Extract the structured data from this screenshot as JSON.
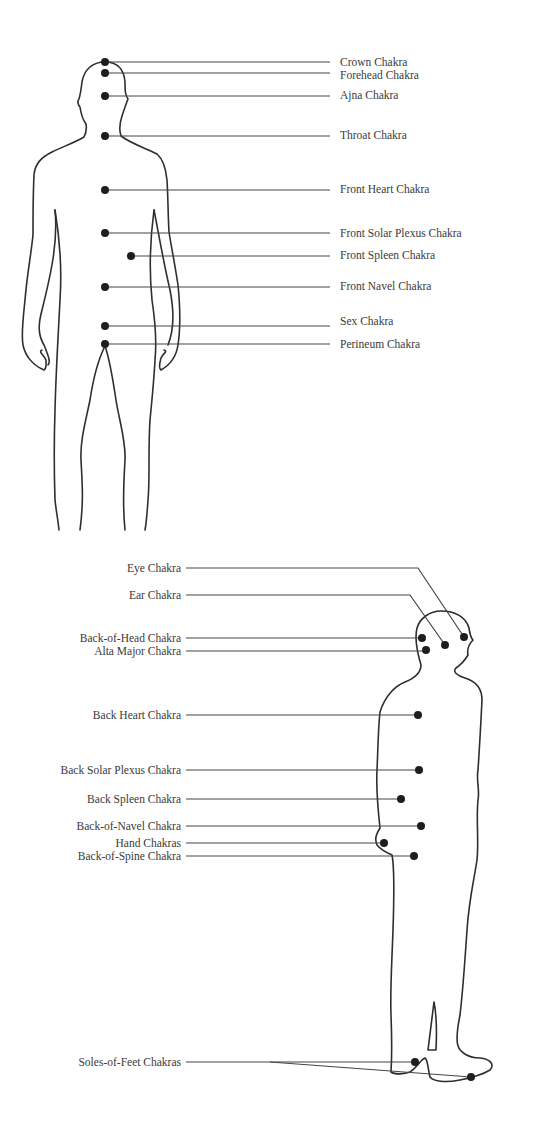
{
  "diagram": {
    "title": "",
    "front_view": {
      "labels": [
        {
          "id": "crown",
          "text": "Crown Chakra",
          "dot": [
            105,
            62
          ],
          "y": 62
        },
        {
          "id": "forehead",
          "text": "Forehead Chakra",
          "dot": [
            105,
            73
          ],
          "y": 73
        },
        {
          "id": "ajna",
          "text": "Ajna Chakra",
          "dot": [
            105,
            96
          ],
          "y": 95
        },
        {
          "id": "throat",
          "text": "Throat Chakra",
          "dot": [
            105,
            136
          ],
          "y": 135
        },
        {
          "id": "front-heart",
          "text": "Front Heart Chakra",
          "dot": [
            105,
            190
          ],
          "y": 189
        },
        {
          "id": "front-solar-plexus",
          "text": "Front Solar Plexus Chakra",
          "dot": [
            105,
            233
          ],
          "y": 233
        },
        {
          "id": "front-spleen",
          "text": "Front Spleen Chakra",
          "dot": [
            131,
            256
          ],
          "y": 255
        },
        {
          "id": "front-navel",
          "text": "Front Navel Chakra",
          "dot": [
            105,
            287
          ],
          "y": 286
        },
        {
          "id": "sex",
          "text": "Sex Chakra",
          "dot": [
            105,
            326
          ],
          "y": 325
        },
        {
          "id": "perineum",
          "text": "Perineum Chakra",
          "dot": [
            105,
            344
          ],
          "y": 344
        }
      ]
    },
    "back_view": {
      "labels": [
        {
          "id": "eye",
          "text": "Eye Chakra",
          "dot": [
            464,
            637
          ],
          "y": 568
        },
        {
          "id": "ear",
          "text": "Ear Chakra",
          "dot": [
            445,
            645
          ],
          "y": 595
        },
        {
          "id": "back-of-head",
          "text": "Back-of-Head Chakra",
          "dot": [
            422,
            638
          ],
          "y": 638
        },
        {
          "id": "alta-major",
          "text": "Alta Major Chakra",
          "dot": [
            426,
            650
          ],
          "y": 651
        },
        {
          "id": "back-heart",
          "text": "Back Heart Chakra",
          "dot": [
            418,
            715
          ],
          "y": 715
        },
        {
          "id": "back-solar-plexus",
          "text": "Back Solar Plexus Chakra",
          "dot": [
            419,
            770
          ],
          "y": 770
        },
        {
          "id": "back-spleen",
          "text": "Back Spleen Chakra",
          "dot": [
            401,
            799
          ],
          "y": 799
        },
        {
          "id": "back-of-navel",
          "text": "Back-of-Navel Chakra",
          "dot": [
            421,
            826
          ],
          "y": 826
        },
        {
          "id": "hand",
          "text": "Hand Chakras",
          "dot": [
            384,
            843
          ],
          "y": 843
        },
        {
          "id": "back-of-spine",
          "text": "Back-of-Spine Chakra",
          "dot": [
            414,
            856
          ],
          "y": 856
        },
        {
          "id": "soles-of-feet",
          "text": "Soles-of-Feet Chakras",
          "dot": [
            415,
            1062
          ],
          "dot2": [
            471,
            1077
          ],
          "y": 1062
        }
      ]
    }
  }
}
